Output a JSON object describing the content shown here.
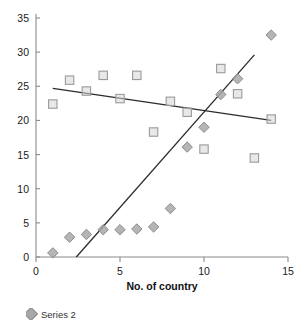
{
  "chart_data": {
    "type": "scatter",
    "title": "",
    "xlabel": "No. of country",
    "ylabel": "",
    "xlim": [
      0,
      15
    ],
    "ylim": [
      0,
      35
    ],
    "xticks": [
      0,
      5,
      10,
      15
    ],
    "yticks": [
      0,
      5,
      10,
      15,
      20,
      25,
      30,
      35
    ],
    "grid": false,
    "legend_position": "bottom-left",
    "series": [
      {
        "name": "Series 1",
        "marker": "square",
        "color": "#d6d6d6",
        "points": [
          {
            "x": 1,
            "y": 22.4
          },
          {
            "x": 2,
            "y": 25.9
          },
          {
            "x": 3,
            "y": 24.3
          },
          {
            "x": 4,
            "y": 26.6
          },
          {
            "x": 5,
            "y": 23.2
          },
          {
            "x": 6,
            "y": 26.6
          },
          {
            "x": 7,
            "y": 18.3
          },
          {
            "x": 8,
            "y": 22.8
          },
          {
            "x": 9,
            "y": 21.2
          },
          {
            "x": 10,
            "y": 15.8
          },
          {
            "x": 11,
            "y": 27.6
          },
          {
            "x": 12,
            "y": 23.9
          },
          {
            "x": 13,
            "y": 14.5
          },
          {
            "x": 14,
            "y": 20.2
          }
        ],
        "trendline": {
          "x1": 1,
          "y1": 24.7,
          "x2": 14,
          "y2": 20.0
        }
      },
      {
        "name": "Series 2",
        "marker": "diamond",
        "color": "#a8a8a8",
        "points": [
          {
            "x": 1,
            "y": 0.6
          },
          {
            "x": 2,
            "y": 2.9
          },
          {
            "x": 3,
            "y": 3.3
          },
          {
            "x": 4,
            "y": 4.0
          },
          {
            "x": 5,
            "y": 4.0
          },
          {
            "x": 6,
            "y": 4.1
          },
          {
            "x": 7,
            "y": 4.4
          },
          {
            "x": 8,
            "y": 7.1
          },
          {
            "x": 9,
            "y": 16.1
          },
          {
            "x": 10,
            "y": 19.0
          },
          {
            "x": 11,
            "y": 23.8
          },
          {
            "x": 12,
            "y": 26.1
          },
          {
            "x": 14,
            "y": 32.5
          }
        ],
        "trendline": {
          "x1": 2.4,
          "y1": 0.0,
          "x2": 13.0,
          "y2": 29.6
        }
      }
    ]
  },
  "axes": {
    "x_title": "No. of country",
    "x_tick_labels": [
      "0",
      "5",
      "10",
      "15"
    ],
    "y_tick_labels": [
      "0",
      "5",
      "10",
      "15",
      "20",
      "25",
      "30",
      "35"
    ]
  },
  "legend": {
    "entries": [
      {
        "label": "Series 2",
        "marker": "diamond"
      }
    ]
  }
}
